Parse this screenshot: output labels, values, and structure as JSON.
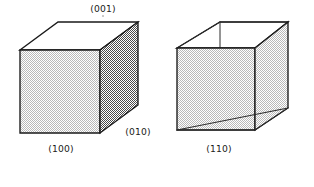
{
  "figure": {
    "background_color": "#ffffff",
    "edge_color": "#1a1a1a",
    "colors": {
      "top_face": "#ffffff",
      "front_face_light": "#d8d8d8",
      "side_face_dark": "#9a9a9a",
      "edge": "#1a1a1a",
      "label": "#1a1a1a"
    },
    "objects": [
      {
        "id": "cube-left",
        "name": "axonometric-cube",
        "faces": [
          {
            "id": "left-top-face",
            "name": "top-face",
            "shade": "white",
            "index": "(001)"
          },
          {
            "id": "left-front-face",
            "name": "front-face",
            "shade": "light-gray",
            "index": "(100)"
          },
          {
            "id": "left-right-face",
            "name": "right-face",
            "shade": "dark-gray",
            "index": "(010)"
          }
        ],
        "labels": [
          {
            "id": "label-001",
            "name": "face-label-001",
            "text": "(001)",
            "x": 103,
            "y": 12,
            "anchor": "middle"
          },
          {
            "id": "label-100",
            "name": "face-label-100",
            "text": "(100)",
            "x": 61,
            "y": 152,
            "anchor": "middle"
          },
          {
            "id": "label-010",
            "name": "face-label-010",
            "text": "(010)",
            "x": 138,
            "y": 135,
            "anchor": "middle"
          }
        ]
      },
      {
        "id": "cube-right",
        "name": "rotated-cube",
        "faces": [
          {
            "id": "right-left-face",
            "name": "left-prism-face",
            "shade": "light-gray",
            "index": "(110)"
          },
          {
            "id": "right-right-face",
            "name": "right-prism-face",
            "shade": "light-gray",
            "index": "(110)"
          },
          {
            "id": "right-top-face",
            "name": "top-face",
            "shade": "white",
            "index": ""
          }
        ],
        "labels": [
          {
            "id": "label-110",
            "name": "face-label-110",
            "text": "(110)",
            "x": 219,
            "y": 152,
            "anchor": "middle"
          }
        ]
      }
    ]
  }
}
